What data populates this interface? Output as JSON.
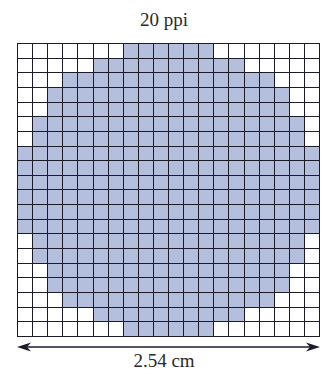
{
  "title": "20 ppi",
  "dimension_label": "2.54 cm",
  "colors": {
    "fill": "#b4bedd",
    "empty": "#ffffff",
    "grid_line": "#1c1c28",
    "text": "#2a2a2a"
  },
  "grid": {
    "columns": 20,
    "rows": 20,
    "filled_ranges": [
      [
        7,
        12
      ],
      [
        5,
        14
      ],
      [
        3,
        16
      ],
      [
        2,
        17
      ],
      [
        2,
        17
      ],
      [
        1,
        18
      ],
      [
        1,
        18
      ],
      [
        0,
        19
      ],
      [
        0,
        19
      ],
      [
        0,
        19
      ],
      [
        0,
        19
      ],
      [
        0,
        19
      ],
      [
        0,
        19
      ],
      [
        1,
        18
      ],
      [
        1,
        18
      ],
      [
        2,
        17
      ],
      [
        2,
        17
      ],
      [
        3,
        16
      ],
      [
        5,
        14
      ],
      [
        7,
        12
      ]
    ]
  }
}
